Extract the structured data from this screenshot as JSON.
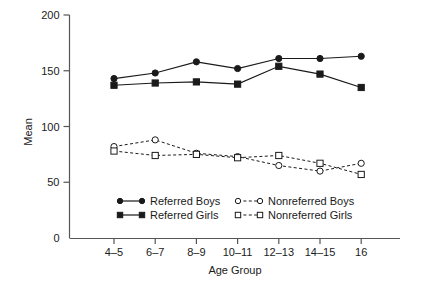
{
  "chart_data": {
    "type": "line",
    "title": "",
    "xlabel": "Age Group",
    "ylabel": "Mean",
    "categories": [
      "4–5",
      "6–7",
      "8–9",
      "10–11",
      "12–13",
      "14–15",
      "16"
    ],
    "ylim": [
      0,
      200
    ],
    "yticks": [
      0,
      50,
      100,
      150,
      200
    ],
    "ytick_labels": [
      "0",
      "50",
      "100",
      "150",
      "200"
    ],
    "grid": false,
    "legend_position": "inside-bottom-center",
    "series": [
      {
        "name": "Referred Boys",
        "marker": "filled-circle",
        "line": "solid",
        "color": "#1a1a1a",
        "values": [
          143,
          148,
          158,
          152,
          161,
          161,
          163
        ]
      },
      {
        "name": "Referred Girls",
        "marker": "filled-square",
        "line": "solid",
        "color": "#1a1a1a",
        "values": [
          137,
          139,
          140,
          138,
          154,
          147,
          135
        ]
      },
      {
        "name": "Nonreferred Boys",
        "marker": "open-circle",
        "line": "dashed",
        "color": "#1a1a1a",
        "values": [
          82,
          88,
          76,
          73,
          65,
          60,
          67
        ]
      },
      {
        "name": "Nonreferred Girls",
        "marker": "open-square",
        "line": "dashed",
        "color": "#1a1a1a",
        "values": [
          78,
          74,
          75,
          72,
          74,
          67,
          57
        ]
      }
    ]
  },
  "axes": {
    "y_label": "Mean",
    "x_label": "Age Group"
  },
  "legend": {
    "entries": [
      {
        "label": "Referred Boys"
      },
      {
        "label": "Referred Girls"
      },
      {
        "label": "Nonreferred Boys"
      },
      {
        "label": "Nonreferred Girls"
      }
    ]
  },
  "colors": {
    "ink": "#1a1a1a",
    "axis": "#555555",
    "background": "#ffffff"
  }
}
